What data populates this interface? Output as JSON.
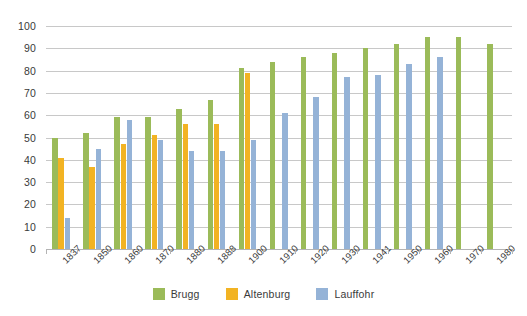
{
  "chart_data": {
    "type": "bar",
    "title": "",
    "subtitle": "",
    "xlabel": "",
    "ylabel": "",
    "ylim": [
      0,
      100
    ],
    "y_ticks": [
      0,
      10,
      20,
      30,
      40,
      50,
      60,
      70,
      80,
      90,
      100
    ],
    "grid": true,
    "legend_position": "bottom",
    "categories": [
      "1837",
      "1850",
      "1860",
      "1870",
      "1880",
      "1888",
      "1900",
      "1910",
      "1920",
      "1930",
      "1941",
      "1950",
      "1960",
      "1970",
      "1980"
    ],
    "series": [
      {
        "name": "Brugg",
        "color": "#9bbb59",
        "values": [
          50,
          52,
          59,
          59,
          63,
          67,
          81,
          84,
          86,
          88,
          90,
          92,
          95,
          95,
          92
        ]
      },
      {
        "name": "Altenburg",
        "color": "#f2b323",
        "values": [
          41,
          37,
          47,
          51,
          56,
          56,
          79,
          null,
          null,
          null,
          null,
          null,
          null,
          null,
          null
        ]
      },
      {
        "name": "Lauffohr",
        "color": "#95b3d7",
        "values": [
          14,
          45,
          58,
          49,
          44,
          44,
          49,
          61,
          68,
          77,
          78,
          83,
          86,
          null,
          null
        ]
      }
    ]
  },
  "legend": {
    "items": [
      {
        "label": "Brugg",
        "color": "#9bbb59"
      },
      {
        "label": "Altenburg",
        "color": "#f2b323"
      },
      {
        "label": "Lauffohr",
        "color": "#95b3d7"
      }
    ]
  },
  "colors": {
    "brugg": "#9bbb59",
    "altenburg": "#f2b323",
    "lauffohr": "#95b3d7",
    "gridline": "#c8c8c8",
    "axis": "#b4b4b4",
    "text": "#3a3a3a",
    "background": "#ffffff"
  }
}
